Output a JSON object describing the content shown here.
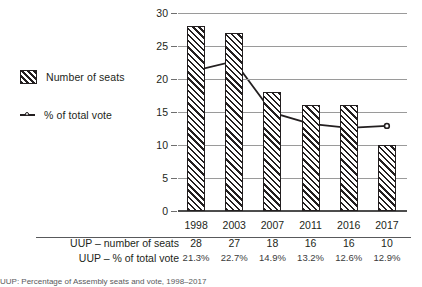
{
  "chart_data": {
    "type": "bar",
    "title": "",
    "xlabel": "",
    "ylabel": "",
    "ylim": [
      0,
      30
    ],
    "yticks": [
      0,
      5,
      10,
      15,
      20,
      25,
      30
    ],
    "ytick_labels": [
      "0",
      "5",
      "10",
      "15",
      "20",
      "25",
      "30"
    ],
    "grid": true,
    "legend_position": "left",
    "categories": [
      "1998",
      "2003",
      "2007",
      "2011",
      "2016",
      "2017"
    ],
    "series": [
      {
        "name": "Number of seats",
        "type": "bar",
        "values": [
          28,
          27,
          18,
          16,
          16,
          10
        ]
      },
      {
        "name": "% of total vote",
        "type": "line",
        "values": [
          21.3,
          22.7,
          14.9,
          13.2,
          12.6,
          12.9
        ]
      }
    ],
    "legend": [
      "Number of seats",
      "% of total vote"
    ]
  },
  "legend": {
    "items": [
      {
        "label": "Number of seats",
        "marker": "hatched-square-swatch"
      },
      {
        "label": "% of total vote",
        "marker": "line-circle-marker"
      }
    ]
  },
  "axis": {
    "y_labels": [
      "30",
      "25",
      "20",
      "15",
      "10",
      "5",
      "0"
    ]
  },
  "x_categories": [
    "1998",
    "2003",
    "2007",
    "2011",
    "2016",
    "2017"
  ],
  "table": {
    "rows": [
      {
        "label": "UUP – number of seats",
        "values": [
          "28",
          "27",
          "18",
          "16",
          "16",
          "10"
        ]
      },
      {
        "label": "UUP – % of total vote",
        "values": [
          "21.3%",
          "22.7%",
          "14.9%",
          "13.2%",
          "12.6%",
          "12.9%"
        ]
      }
    ]
  },
  "caption": {
    "text": "UUP: Percentage of Assembly seats and vote, 1998–2017"
  },
  "colors": {
    "ink": "#231f20",
    "gridline": "#9a9a9a",
    "axis": "#4d4d4d",
    "rule": "#58595b",
    "background": "#ffffff"
  }
}
